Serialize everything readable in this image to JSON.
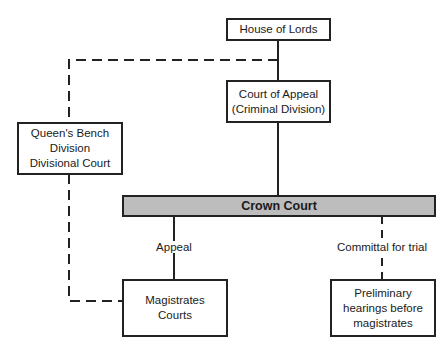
{
  "diagram": {
    "nodes": {
      "house_of_lords": {
        "lines": [
          "House of Lords"
        ]
      },
      "court_of_appeal": {
        "lines": [
          "Court of Appeal",
          "(Criminal Division)"
        ]
      },
      "queens_bench": {
        "lines": [
          "Queen's Bench",
          "Division",
          "Divisional Court"
        ]
      },
      "crown_court": {
        "lines": [
          "Crown Court"
        ]
      },
      "magistrates": {
        "lines": [
          "Magistrates",
          "Courts"
        ]
      },
      "preliminary": {
        "lines": [
          "Preliminary",
          "hearings before",
          "magistrates"
        ]
      }
    },
    "edge_labels": {
      "appeal": "Appeal",
      "committal": "Committal for trial"
    },
    "colors": {
      "line": "#222222",
      "crown_court_fill": "#bdbdbd"
    }
  }
}
